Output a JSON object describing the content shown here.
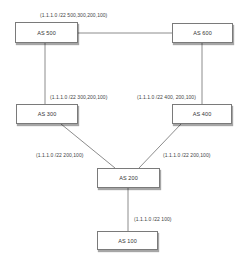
{
  "diagram": {
    "type": "network-topology",
    "nodes": [
      {
        "id": "as500",
        "label": "AS 500",
        "x": 15,
        "y": 22,
        "w": 63,
        "h": 21
      },
      {
        "id": "as600",
        "label": "AS 600",
        "x": 172,
        "y": 23,
        "w": 61,
        "h": 20
      },
      {
        "id": "as300",
        "label": "AS 300",
        "x": 16,
        "y": 104,
        "w": 62,
        "h": 20
      },
      {
        "id": "as400",
        "label": "AS 400",
        "x": 172,
        "y": 104,
        "w": 60,
        "h": 20
      },
      {
        "id": "as200",
        "label": "AS 200",
        "x": 97,
        "y": 168,
        "w": 63,
        "h": 20
      },
      {
        "id": "as100",
        "label": "AS 100",
        "x": 97,
        "y": 231,
        "w": 61,
        "h": 19
      }
    ],
    "edges": [
      {
        "from": "AS 500",
        "to": "AS 600"
      },
      {
        "from": "AS 500",
        "to": "AS 300"
      },
      {
        "from": "AS 600",
        "to": "AS 400"
      },
      {
        "from": "AS 300",
        "to": "AS 200"
      },
      {
        "from": "AS 400",
        "to": "AS 200"
      },
      {
        "from": "AS 200",
        "to": "AS 100"
      }
    ],
    "labels": [
      {
        "id": "as500-path",
        "text": "(1.1.1.0 /22 500,300,200,100)",
        "x": 40,
        "y": 12
      },
      {
        "id": "as300-path",
        "text": "(1.1.1.0 /22 300,200,100)",
        "x": 50,
        "y": 94
      },
      {
        "id": "as400-path",
        "text": "(1.1.1.0 /22 400, 200,100)",
        "x": 137,
        "y": 94
      },
      {
        "id": "as300-from-200-path",
        "text": "(1.1.1.0 /22 200,100)",
        "x": 36,
        "y": 152
      },
      {
        "id": "as400-from-200-path",
        "text": "(1.1.1.0 /22 200,100)",
        "x": 163,
        "y": 152
      },
      {
        "id": "as200-path",
        "text": "(1.1.1.0 /22 100)",
        "x": 134,
        "y": 216
      }
    ]
  }
}
